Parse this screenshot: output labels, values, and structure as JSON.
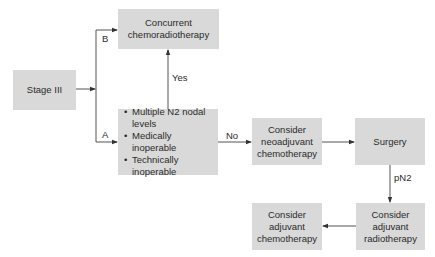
{
  "diagram": {
    "nodes": {
      "stage": {
        "label": "Stage III"
      },
      "concurrent": {
        "line1": "Concurrent",
        "line2": "chemoradiotherapy"
      },
      "criteria": {
        "items": [
          "Multiple N2 nodal levels",
          "Medically inoperable",
          "Technically inoperable"
        ]
      },
      "neoadjuvant": {
        "line1": "Consider",
        "line2": "neoadjuvant",
        "line3": "chemotherapy"
      },
      "surgery": {
        "label": "Surgery"
      },
      "adj_radio": {
        "line1": "Consider",
        "line2": "adjuvant",
        "line3": "radiotherapy"
      },
      "adj_chemo": {
        "line1": "Consider",
        "line2": "adjuvant",
        "line3": "chemotherapy"
      }
    },
    "edge_labels": {
      "b": "B",
      "a": "A",
      "yes": "Yes",
      "no": "No",
      "pn2": "pN2"
    },
    "colors": {
      "box_fill": "#d9d9d9",
      "line": "#333333"
    }
  }
}
